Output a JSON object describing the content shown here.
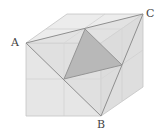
{
  "diagram": {
    "type": "cube",
    "labels": {
      "a": "A",
      "b": "B",
      "c": "C"
    },
    "colors": {
      "front_face": "#e6e6e6",
      "top_face": "#ececec",
      "right_face": "#dedede",
      "triangle_abc": "#dadada",
      "shaded_triangle": "#b8b8b8",
      "edge": "#9a9a9a",
      "grid": "#cfcfcf"
    }
  }
}
